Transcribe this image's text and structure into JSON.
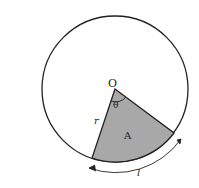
{
  "diagram": {
    "type": "circle-sector",
    "labels": {
      "center": "O",
      "angle": "θ",
      "radius": "r",
      "area": "A",
      "arc_length": "l"
    },
    "colors": {
      "stroke": "#222222",
      "sector_fill": "#a8a8a8",
      "background": "#ffffff"
    }
  }
}
